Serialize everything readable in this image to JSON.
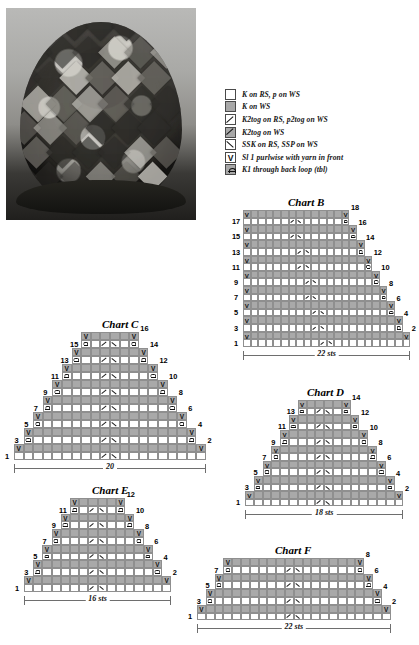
{
  "photo": {
    "alt": "Knitted patchwork hat crown, black and white photograph"
  },
  "legend": {
    "items": [
      {
        "symbol": "open-square",
        "label": "K on RS, p on WS"
      },
      {
        "symbol": "gray-square",
        "label": "K on WS"
      },
      {
        "symbol": "k2tog-slash",
        "label": "K2tog on RS, p2tog on WS"
      },
      {
        "symbol": "k2tog-gray",
        "label": "K2tog on WS"
      },
      {
        "symbol": "ssk-backslash",
        "label": "SSK on RS, SSP on WS"
      },
      {
        "symbol": "sl1-purlwise-v",
        "label": "Sl 1 purlwise with yarn in front"
      },
      {
        "symbol": "k1-tbl",
        "label": "K1 through back loop (tbl)"
      }
    ]
  },
  "charts": [
    {
      "id": "chart-b",
      "title": "Chart B",
      "measure": "22 sts",
      "stitches": 22,
      "rows": 18,
      "shape": "right-triangle",
      "row_labels_left": [
        1,
        3,
        5,
        7,
        9,
        11,
        13,
        15,
        17
      ],
      "row_labels_right": [
        2,
        4,
        6,
        8,
        10,
        12,
        14,
        16,
        18
      ]
    },
    {
      "id": "chart-c",
      "title": "Chart C",
      "measure": "20",
      "stitches": 20,
      "rows": 16,
      "shape": "isosceles-triangle",
      "row_labels_left": [
        1,
        3,
        5,
        7,
        9,
        11,
        13,
        15
      ],
      "row_labels_right": [
        2,
        4,
        6,
        8,
        10,
        12,
        14,
        16
      ]
    },
    {
      "id": "chart-d",
      "title": "Chart D",
      "measure": "18 sts",
      "stitches": 18,
      "rows": 14,
      "shape": "isosceles-triangle",
      "row_labels_left": [
        1,
        3,
        5,
        7,
        9,
        11,
        13
      ],
      "row_labels_right": [
        2,
        4,
        6,
        8,
        10,
        12,
        14
      ]
    },
    {
      "id": "chart-e",
      "title": "Chart E",
      "measure": "16 sts",
      "stitches": 16,
      "rows": 12,
      "shape": "isosceles-triangle",
      "row_labels_left": [
        1,
        3,
        5,
        7,
        9,
        11
      ],
      "row_labels_right": [
        2,
        4,
        6,
        8,
        10,
        12
      ]
    },
    {
      "id": "chart-f",
      "title": "Chart F",
      "measure": "22 sts",
      "stitches": 22,
      "rows": 8,
      "shape": "isosceles-triangle",
      "row_labels_left": [
        1,
        3,
        5,
        7
      ],
      "row_labels_right": [
        2,
        4,
        6,
        8
      ]
    }
  ]
}
